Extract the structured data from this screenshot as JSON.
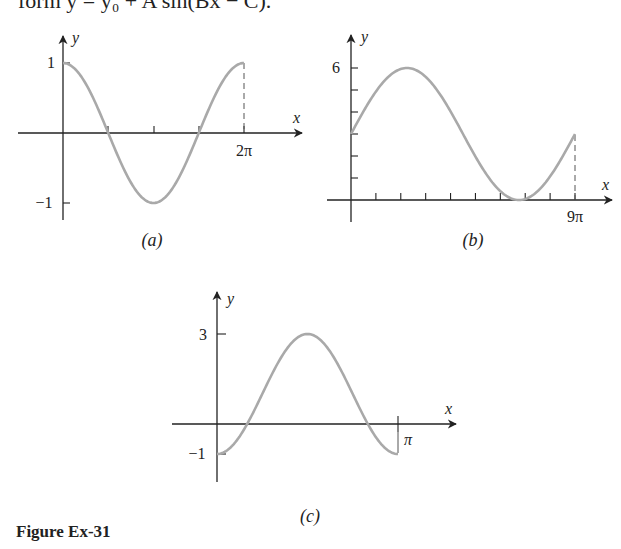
{
  "header": {
    "top_line": "form y = y₀ + A sin(Bx − C)."
  },
  "figure": {
    "caption": "Figure Ex-31",
    "curve_color": "#a9a9a9",
    "axis_color": "#222222"
  },
  "chart_data": [
    {
      "type": "line",
      "panel": "(a)",
      "xlabel": "x",
      "ylabel": "y",
      "x_tick_labels": [
        "2π"
      ],
      "x_ticks": [
        "π/2",
        "π",
        "3π/2",
        "2π"
      ],
      "y_tick_labels": [
        "1",
        "−1"
      ],
      "xlim": [
        0,
        6.2832
      ],
      "ylim": [
        -1,
        1
      ],
      "series": [
        {
          "name": "curve-a",
          "x": [
            0,
            0.7854,
            1.5708,
            2.3562,
            3.1416,
            3.927,
            4.7124,
            5.4978,
            6.2832
          ],
          "y": [
            1,
            0.707,
            0,
            -0.707,
            -1,
            -0.707,
            0,
            0.707,
            1
          ]
        }
      ],
      "annotations": [
        "dashed vertical line at x = 2π"
      ]
    },
    {
      "type": "line",
      "panel": "(b)",
      "xlabel": "x",
      "ylabel": "y",
      "x_tick_labels": [
        "9π"
      ],
      "x_ticks": [
        "π",
        "2π",
        "3π",
        "4π",
        "5π",
        "6π",
        "7π",
        "8π",
        "9π"
      ],
      "y_tick_labels": [
        "6"
      ],
      "y_ticks": [
        1,
        2,
        3,
        4,
        5,
        6
      ],
      "xlim": [
        0,
        28.274
      ],
      "ylim": [
        0,
        6
      ],
      "series": [
        {
          "name": "curve-b",
          "x": [
            0,
            3.534,
            7.069,
            10.603,
            14.137,
            17.671,
            21.206,
            24.74,
            28.274
          ],
          "y": [
            3,
            5.12,
            6,
            5.12,
            3,
            0.88,
            0,
            0.88,
            3
          ]
        }
      ],
      "annotations": [
        "dashed vertical line at x = 9π"
      ]
    },
    {
      "type": "line",
      "panel": "(c)",
      "xlabel": "x",
      "ylabel": "y",
      "x_tick_labels": [
        "π"
      ],
      "x_ticks": [
        "π"
      ],
      "y_tick_labels": [
        "3",
        "−1"
      ],
      "xlim": [
        0,
        3.1416
      ],
      "ylim": [
        -1,
        3
      ],
      "series": [
        {
          "name": "curve-c",
          "x": [
            0,
            0.3927,
            0.7854,
            1.1781,
            1.5708,
            1.9635,
            2.3562,
            2.7489,
            3.1416
          ],
          "y": [
            -1,
            -0.414,
            1,
            2.414,
            3,
            2.414,
            1,
            -0.414,
            -1
          ]
        }
      ]
    }
  ],
  "panels": {
    "a": {
      "label": "(a)",
      "xlabel": "x",
      "ylabel": "y",
      "tick_x": "2π",
      "tick_y_top": "1",
      "tick_y_bottom": "−1"
    },
    "b": {
      "label": "(b)",
      "xlabel": "x",
      "ylabel": "y",
      "tick_x": "9π",
      "tick_y_top": "6"
    },
    "c": {
      "label": "(c)",
      "xlabel": "x",
      "ylabel": "y",
      "tick_x": "π",
      "tick_y_top": "3",
      "tick_y_bottom": "−1"
    }
  }
}
